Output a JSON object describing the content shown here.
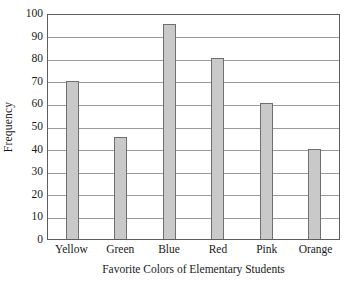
{
  "chart_data": {
    "type": "bar",
    "title": "",
    "subtitle": "",
    "xlabel": "Favorite Colors of Elementary Students",
    "ylabel": "Frequency",
    "categories": [
      "Yellow",
      "Green",
      "Blue",
      "Red",
      "Pink",
      "Orange"
    ],
    "values": [
      70,
      45,
      95,
      80,
      60,
      40
    ],
    "series": [
      {
        "name": "Frequency",
        "values": [
          70,
          45,
          95,
          80,
          60,
          40
        ]
      }
    ],
    "ylim": [
      0,
      100
    ],
    "ytick_labels": [
      "100",
      "90",
      "80",
      "70",
      "60",
      "50",
      "40",
      "30",
      "20",
      "10",
      "0"
    ],
    "ytick_values": [
      100,
      90,
      80,
      70,
      60,
      50,
      40,
      30,
      20,
      10,
      0
    ],
    "ytick_step": 10,
    "grid": "horizontal",
    "legend": "none",
    "legend_position": "none",
    "annotations": [],
    "colors": {
      "bar_fill": "#c9c9c9",
      "bar_border": "#6f6f6f",
      "gridline": "#9a9a9a",
      "frame": "#5d5d5d",
      "background": "#ffffff",
      "text": "#1a1a1a"
    }
  }
}
